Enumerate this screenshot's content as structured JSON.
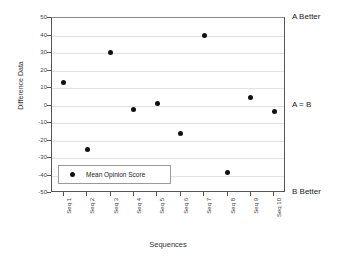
{
  "chart_data": {
    "type": "scatter",
    "title": "",
    "xlabel": "Sequences",
    "ylabel": "Difference Data",
    "categories": [
      "Seq 1",
      "Seq 2",
      "Seq 3",
      "Seq 4",
      "Seq 5",
      "Seq 6",
      "Seq 7",
      "Seq 8",
      "Seq 9",
      "Seq 10"
    ],
    "series": [
      {
        "name": "Mean Opinion Score",
        "marker": "filled-circle",
        "color": "#111111",
        "values": [
          13,
          -25,
          30.5,
          -2,
          1,
          -16,
          40,
          -38.5,
          4.5,
          -3.5
        ]
      }
    ],
    "ylim": [
      -50,
      50
    ],
    "yticks": [
      50,
      40,
      30,
      20,
      10,
      0,
      -10,
      -20,
      -30,
      -40,
      -50
    ],
    "ytick_labels": [
      "50",
      "40",
      "30",
      "20",
      "10",
      "0",
      "-10",
      "-20",
      "-30",
      "-40",
      "-50"
    ],
    "grid": true,
    "grid_axis": "y",
    "grid_color": "#e2e2e2",
    "legend_position": "lower-left",
    "annotations": [
      {
        "text": "A Better",
        "value": 50,
        "position": "right"
      },
      {
        "text": "A = B",
        "value": 0,
        "position": "right"
      },
      {
        "text": "B Better",
        "value": -50,
        "position": "right"
      }
    ]
  },
  "legend": {
    "entry_label": "Mean Opinion Score"
  }
}
